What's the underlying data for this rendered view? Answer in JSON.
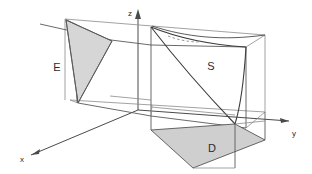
{
  "figure": {
    "background_color": "#ffffff",
    "line_color": "#4a4a4a",
    "shade_color": "#d4d4d4",
    "axes": [
      {
        "name": "x",
        "label": "x",
        "direction": "down-left",
        "label_x": 22,
        "label_y": 160
      },
      {
        "name": "y",
        "label": "y",
        "direction": "right",
        "label_x": 293,
        "label_y": 135
      },
      {
        "name": "z",
        "label": "z",
        "direction": "up",
        "label_x": 131,
        "label_y": 15
      }
    ],
    "regions": [
      {
        "name": "E",
        "label": "E",
        "kind": "shaded-triangle",
        "label_x": 57,
        "label_y": 71,
        "fill": "#d6d6d6"
      },
      {
        "name": "S",
        "label": "S",
        "kind": "curved-surface",
        "label_x": 211,
        "label_y": 70,
        "fill": "none"
      },
      {
        "name": "D",
        "label": "D",
        "kind": "shaded-quadrilateral",
        "label_x": 212,
        "label_y": 152,
        "fill": "#cfcfcf"
      }
    ]
  }
}
